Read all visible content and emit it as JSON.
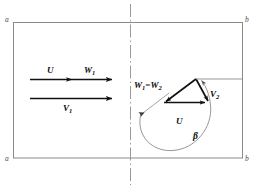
{
  "figure": {
    "type": "engineering-vector-diagram",
    "width": 255,
    "height": 189,
    "background_color": "#ffffff",
    "line_color": "#7a7a7a",
    "vector_color": "#111111"
  },
  "boundary": {
    "name": "control-volume-box",
    "corner_labels": {
      "top_left": "a",
      "top_right": "b",
      "bottom_left": "a",
      "bottom_right": "b"
    }
  },
  "centerline": {
    "name": "station-centerline",
    "style": "dash-dot",
    "orientation": "vertical"
  },
  "upstream": {
    "vector_top": {
      "label_left": "U",
      "label_right": "W",
      "label_right_sub": "1"
    },
    "vector_bottom": {
      "label": "V",
      "label_sub": "1"
    }
  },
  "downstream": {
    "relative_velocity": {
      "label": "W",
      "label_sub_1": "1",
      "equals": "=",
      "label2": "W",
      "label_sub_2": "2"
    },
    "absolute_velocity": {
      "label": "V",
      "label_sub": "2"
    },
    "blade_speed": {
      "label": "U"
    },
    "angle": {
      "label": "β"
    }
  }
}
